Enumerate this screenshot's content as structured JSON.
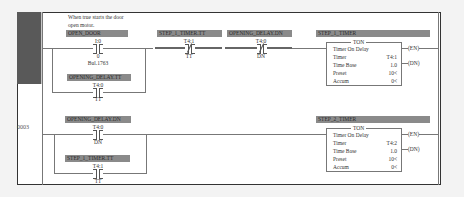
{
  "rungs": [
    {
      "number": "",
      "comment": "When true starts the door open motor.",
      "branch_main": {
        "tag": "OPEN_DOOR",
        "address": "I:0",
        "bit": "0",
        "description": "Bul.1763",
        "type": "XIC"
      },
      "branch_parallel": {
        "tag": "OPENING_DELAY.TT",
        "address": "T4:0",
        "bit": "TT",
        "type": "XIC"
      },
      "series": [
        {
          "tag": "STEP_1_TIMER.TT",
          "address": "T4:1",
          "bit": "TT",
          "type": "XIO"
        },
        {
          "tag": "OPENING_DELAY.DN",
          "address": "T4:0",
          "bit": "DN",
          "type": "XIO"
        }
      ],
      "output": {
        "tag": "STEP_1_TIMER",
        "type": "TON",
        "title": "Timer On Delay",
        "timer_label": "Timer",
        "timer": "T4:1",
        "timebase_label": "Time Base",
        "timebase": "1.0",
        "preset_label": "Preset",
        "preset": "10<",
        "accum_label": "Accum",
        "accum": "0<",
        "en": "EN",
        "dn": "DN"
      }
    },
    {
      "number": "0003",
      "branch_main": {
        "tag": "OPENING_DELAY.DN",
        "address": "T4:0",
        "bit": "DN",
        "type": "XIC"
      },
      "branch_parallel": {
        "tag": "STEP_1_TIMER.TT",
        "address": "T4:1",
        "bit": "TT",
        "type": "XIC"
      },
      "output": {
        "tag": "STEP_2_TIMER",
        "type": "TON",
        "title": "Timer On Delay",
        "timer_label": "Timer",
        "timer": "T4:2",
        "timebase_label": "Time Base",
        "timebase": "1.0",
        "preset_label": "Preset",
        "preset": "10<",
        "accum_label": "Accum",
        "accum": "0<",
        "en": "EN",
        "dn": "DN"
      }
    }
  ]
}
